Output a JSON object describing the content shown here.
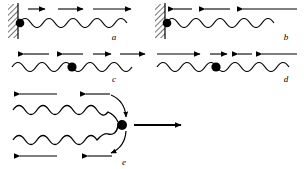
{
  "figure": {
    "background_color": "#ffffff",
    "stroke_color": "#000000",
    "bead_color": "#000000",
    "width": 304,
    "height": 169
  },
  "panels": [
    {
      "id": "a",
      "label": "a",
      "label_x": 114,
      "label_y": 40,
      "has_wall": true,
      "wall_side": "left",
      "bead_on_wall": true,
      "bead_label": "bead",
      "wave_count": 1,
      "arrow_rows": [
        {
          "direction": "right",
          "count": 3,
          "description": "three right-pointing arrows above the wave"
        }
      ],
      "description": "Wave train travelling right along a string fixed at a hatched wall on the left with a bead at the wall."
    },
    {
      "id": "b",
      "label": "b",
      "label_x": 286,
      "label_y": 40,
      "has_wall": true,
      "wall_side": "left",
      "bead_on_wall": true,
      "bead_label": "bead",
      "wave_count": 1,
      "arrow_rows": [
        {
          "direction": "left",
          "count": 3,
          "description": "three left-pointing arrows above the wave"
        }
      ],
      "description": "Wave train travelling left toward a hatched wall on the left with a bead at the wall."
    },
    {
      "id": "c",
      "label": "c",
      "label_x": 114,
      "label_y": 82,
      "has_wall": false,
      "wall_side": "none",
      "bead_on_wall": false,
      "bead_label": "bead",
      "wave_count": 1,
      "arrow_rows": [
        {
          "direction": "left",
          "count": 2,
          "description": "two left-pointing arrows on the left half"
        },
        {
          "direction": "right",
          "count": 2,
          "description": "two right-pointing arrows on the right half"
        }
      ],
      "description": "Free string carrying a bead; arrows point outward away from the bead."
    },
    {
      "id": "d",
      "label": "d",
      "label_x": 286,
      "label_y": 82,
      "has_wall": false,
      "wall_side": "none",
      "bead_on_wall": false,
      "bead_label": "bead",
      "wave_count": 1,
      "arrow_rows": [
        {
          "direction": "right",
          "count": 2,
          "description": "two right-pointing arrows on the left half"
        },
        {
          "direction": "left",
          "count": 2,
          "description": "two left-pointing arrows on the right half"
        }
      ],
      "description": "Free string carrying a bead; arrows point inward toward the bead."
    },
    {
      "id": "e",
      "label": "e",
      "label_x": 124,
      "label_y": 163,
      "has_wall": false,
      "wall_side": "none",
      "bead_on_wall": false,
      "bead_label": "bead",
      "wave_count": 2,
      "arrow_rows": [
        {
          "direction": "left",
          "count": 2,
          "description": "two left-pointing arrows above the upper wave"
        },
        {
          "direction": "left",
          "count": 2,
          "description": "two left-pointing arrows below the lower wave"
        },
        {
          "direction": "right",
          "count": 1,
          "description": "one long right-pointing arrow leaving the bead"
        }
      ],
      "curved_arrows": [
        {
          "position": "upper",
          "description": "curved arrow arcing over the junction"
        },
        {
          "position": "lower",
          "description": "curved arrow arcing under the junction"
        }
      ],
      "description": "Two wave trains on separate strings meeting at a common bead which moves to the right."
    }
  ]
}
